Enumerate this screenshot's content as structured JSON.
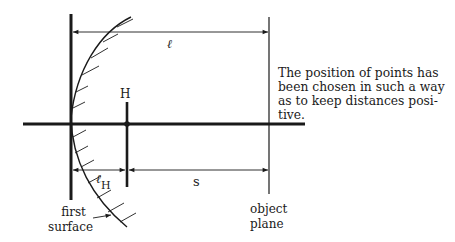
{
  "diagram": {
    "labels": {
      "H": "H",
      "l": "ℓ",
      "lH_main": "ℓ",
      "lH_sub": "H",
      "s": "s",
      "object_plane": [
        "object",
        "plane"
      ],
      "first_surface": [
        "first",
        "surface"
      ]
    },
    "note_lines": [
      "The position of points has",
      "been chosen in such a way",
      "as to keep distances posi-",
      "tive."
    ],
    "colors": {
      "ink": "#1a1a1a",
      "background": "#ffffff"
    }
  }
}
